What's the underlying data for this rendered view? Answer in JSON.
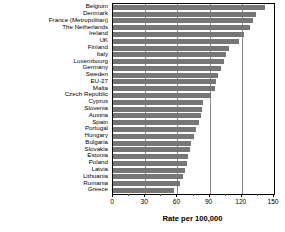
{
  "chart_data": {
    "type": "bar",
    "orientation": "horizontal",
    "title": "",
    "xlabel": "Rate per 100,000",
    "ylabel": "",
    "xlim": [
      0,
      150
    ],
    "xticks": [
      0,
      30,
      60,
      90,
      120,
      150
    ],
    "minor_ticks": [
      15,
      45,
      75,
      105,
      135
    ],
    "grid": true,
    "legend": null,
    "bar_color": "#767676",
    "categories": [
      "Belgium",
      "Denmark",
      "France (Metropolitan)",
      "The Netherlands",
      "Ireland",
      "UK",
      "Finland",
      "Italy",
      "Luxembourg",
      "Germany",
      "Sweden",
      "EU-27",
      "Malta",
      "Czech Republic",
      "Cyprus",
      "Slovenia",
      "Austria",
      "Spain",
      "Portugal",
      "Hungary",
      "Bulgaria",
      "Slovakia",
      "Estonia",
      "Poland",
      "Latvia",
      "Lithuania",
      "Romania",
      "Greece"
    ],
    "values": [
      142,
      133,
      130,
      128,
      122,
      117,
      108,
      105,
      103,
      101,
      98,
      96,
      95,
      91,
      84,
      83,
      82,
      80,
      77,
      75,
      73,
      72,
      70,
      69,
      67,
      65,
      62,
      57
    ]
  },
  "axis": {
    "tick_labels": [
      "0",
      "30",
      "60",
      "90",
      "120",
      "150"
    ],
    "title": "Rate per 100,000"
  }
}
